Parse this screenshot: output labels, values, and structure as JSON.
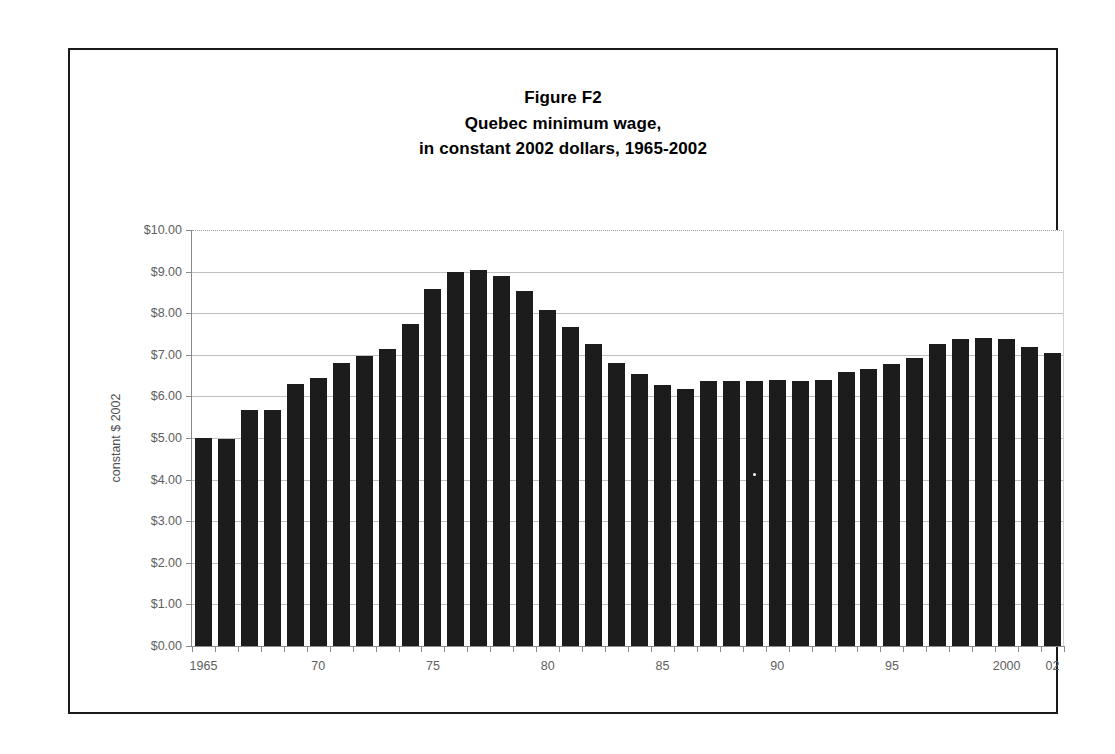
{
  "figure": {
    "title_lines": [
      "Figure F2",
      "Quebec minimum wage,",
      "in constant 2002 dollars, 1965-2002"
    ]
  },
  "chart_data": {
    "type": "bar",
    "title": "Figure F2 Quebec minimum wage, in constant 2002 dollars, 1965-2002",
    "xlabel": "",
    "ylabel": "constant $ 2002",
    "ylim": [
      0,
      10
    ],
    "ytick_step": 1,
    "ytick_labels": [
      "$0.00",
      "$1.00",
      "$2.00",
      "$3.00",
      "$4.00",
      "$5.00",
      "$6.00",
      "$7.00",
      "$8.00",
      "$9.00",
      "$10.00"
    ],
    "grid": true,
    "legend": "none",
    "bar_color": "#1c1c1c",
    "x_tick_labels": [
      {
        "year": 1965,
        "label": "1965"
      },
      {
        "year": 1970,
        "label": "70"
      },
      {
        "year": 1975,
        "label": "75"
      },
      {
        "year": 1980,
        "label": "80"
      },
      {
        "year": 1985,
        "label": "85"
      },
      {
        "year": 1990,
        "label": "90"
      },
      {
        "year": 1995,
        "label": "95"
      },
      {
        "year": 2000,
        "label": "2000"
      },
      {
        "year": 2002,
        "label": "02"
      }
    ],
    "categories": [
      1965,
      1966,
      1967,
      1968,
      1969,
      1970,
      1971,
      1972,
      1973,
      1974,
      1975,
      1976,
      1977,
      1978,
      1979,
      1980,
      1981,
      1982,
      1983,
      1984,
      1985,
      1986,
      1987,
      1988,
      1989,
      1990,
      1991,
      1992,
      1993,
      1994,
      1995,
      1996,
      1997,
      1998,
      1999,
      2000,
      2001,
      2002
    ],
    "values": [
      5.0,
      4.97,
      5.67,
      5.67,
      6.3,
      6.45,
      6.8,
      6.98,
      7.15,
      7.75,
      8.58,
      9.0,
      9.05,
      8.9,
      8.53,
      8.08,
      7.68,
      7.25,
      6.8,
      6.55,
      6.28,
      6.18,
      6.37,
      6.38,
      6.38,
      6.4,
      6.38,
      6.4,
      6.58,
      6.67,
      6.78,
      6.93,
      7.25,
      7.37,
      7.4,
      7.37,
      7.18,
      7.05
    ]
  }
}
